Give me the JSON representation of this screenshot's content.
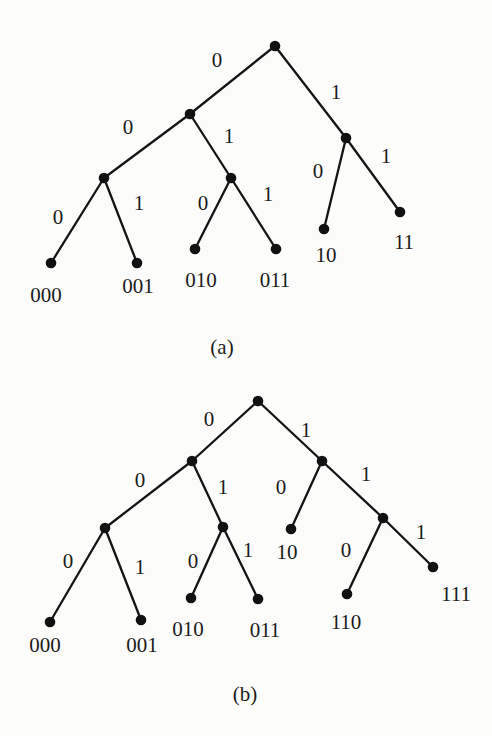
{
  "colors": {
    "background": "#fcfcfa",
    "ink": "#1b1b1b",
    "line": "#141414",
    "node": "#111111"
  },
  "figures": [
    {
      "id": "a",
      "caption": "(a)",
      "nodes": {
        "root": {
          "x": 275,
          "y": 46
        },
        "n0": {
          "x": 190,
          "y": 114
        },
        "n1": {
          "x": 346,
          "y": 138
        },
        "n00": {
          "x": 104,
          "y": 178
        },
        "n01": {
          "x": 231,
          "y": 178
        },
        "l000": {
          "x": 51,
          "y": 263
        },
        "l001": {
          "x": 137,
          "y": 263
        },
        "l010": {
          "x": 195,
          "y": 249
        },
        "l011": {
          "x": 276,
          "y": 249
        },
        "l10": {
          "x": 324,
          "y": 229
        },
        "l11": {
          "x": 400,
          "y": 212
        }
      },
      "edges": [
        {
          "from": "root",
          "to": "n0",
          "label": "0",
          "lx": 217,
          "ly": 60
        },
        {
          "from": "root",
          "to": "n1",
          "label": "1",
          "lx": 336,
          "ly": 92
        },
        {
          "from": "n0",
          "to": "n00",
          "label": "0",
          "lx": 128,
          "ly": 127
        },
        {
          "from": "n0",
          "to": "n01",
          "label": "1",
          "lx": 229,
          "ly": 136
        },
        {
          "from": "n00",
          "to": "l000",
          "label": "0",
          "lx": 58,
          "ly": 217
        },
        {
          "from": "n00",
          "to": "l001",
          "label": "1",
          "lx": 139,
          "ly": 203
        },
        {
          "from": "n01",
          "to": "l010",
          "label": "0",
          "lx": 203,
          "ly": 203
        },
        {
          "from": "n01",
          "to": "l011",
          "label": "1",
          "lx": 268,
          "ly": 194
        },
        {
          "from": "n1",
          "to": "l10",
          "label": "0",
          "lx": 318,
          "ly": 171
        },
        {
          "from": "n1",
          "to": "l11",
          "label": "1",
          "lx": 386,
          "ly": 156
        }
      ],
      "leaf_labels": [
        {
          "text": "000",
          "x": 46,
          "y": 295
        },
        {
          "text": "001",
          "x": 138,
          "y": 286
        },
        {
          "text": "010",
          "x": 201,
          "y": 280
        },
        {
          "text": "011",
          "x": 275,
          "y": 280
        },
        {
          "text": "10",
          "x": 326,
          "y": 255
        },
        {
          "text": "11",
          "x": 404,
          "y": 242
        }
      ]
    },
    {
      "id": "b",
      "caption": "(b)",
      "nodes": {
        "root": {
          "x": 258,
          "y": 401
        },
        "n0": {
          "x": 192,
          "y": 461
        },
        "n1": {
          "x": 322,
          "y": 461
        },
        "n00": {
          "x": 105,
          "y": 528
        },
        "n01": {
          "x": 223,
          "y": 527
        },
        "l10": {
          "x": 291,
          "y": 529
        },
        "n11": {
          "x": 383,
          "y": 518
        },
        "l000": {
          "x": 50,
          "y": 622
        },
        "l001": {
          "x": 141,
          "y": 620
        },
        "l010": {
          "x": 191,
          "y": 598
        },
        "l011": {
          "x": 258,
          "y": 599
        },
        "l110": {
          "x": 347,
          "y": 594
        },
        "l111": {
          "x": 433,
          "y": 567
        }
      },
      "edges": [
        {
          "from": "root",
          "to": "n0",
          "label": "0",
          "lx": 209,
          "ly": 419
        },
        {
          "from": "root",
          "to": "n1",
          "label": "1",
          "lx": 306,
          "ly": 430
        },
        {
          "from": "n0",
          "to": "n00",
          "label": "0",
          "lx": 140,
          "ly": 480
        },
        {
          "from": "n0",
          "to": "n01",
          "label": "1",
          "lx": 223,
          "ly": 487
        },
        {
          "from": "n1",
          "to": "l10",
          "label": "0",
          "lx": 281,
          "ly": 487
        },
        {
          "from": "n1",
          "to": "n11",
          "label": "1",
          "lx": 366,
          "ly": 474
        },
        {
          "from": "n00",
          "to": "l000",
          "label": "0",
          "lx": 68,
          "ly": 561
        },
        {
          "from": "n00",
          "to": "l001",
          "label": "1",
          "lx": 140,
          "ly": 567
        },
        {
          "from": "n01",
          "to": "l010",
          "label": "0",
          "lx": 193,
          "ly": 561
        },
        {
          "from": "n01",
          "to": "l011",
          "label": "1",
          "lx": 248,
          "ly": 550
        },
        {
          "from": "n11",
          "to": "l110",
          "label": "0",
          "lx": 346,
          "ly": 550
        },
        {
          "from": "n11",
          "to": "l111",
          "label": "1",
          "lx": 421,
          "ly": 532
        }
      ],
      "leaf_labels": [
        {
          "text": "000",
          "x": 45,
          "y": 645
        },
        {
          "text": "001",
          "x": 142,
          "y": 645
        },
        {
          "text": "010",
          "x": 188,
          "y": 629
        },
        {
          "text": "011",
          "x": 265,
          "y": 630
        },
        {
          "text": "10",
          "x": 287,
          "y": 552
        },
        {
          "text": "110",
          "x": 346,
          "y": 622
        },
        {
          "text": "111",
          "x": 456,
          "y": 594
        }
      ]
    }
  ]
}
